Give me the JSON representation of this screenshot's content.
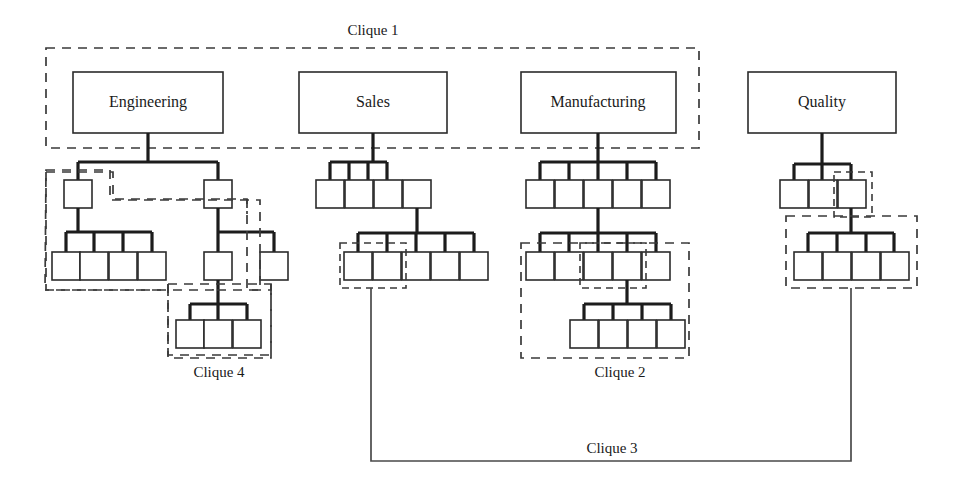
{
  "diagram": {
    "background_color": "#ffffff",
    "line_color": "#1c1c1c",
    "box_fill": "#ffffff",
    "dashed_color": "#3a3a3a"
  },
  "departments": [
    {
      "id": "engineering",
      "label": "Engineering",
      "x": 73,
      "y": 72,
      "w": 150,
      "h": 61
    },
    {
      "id": "sales",
      "label": "Sales",
      "x": 299,
      "y": 72,
      "w": 148,
      "h": 61
    },
    {
      "id": "manufacturing",
      "label": "Manufacturing",
      "x": 521,
      "y": 72,
      "w": 155,
      "h": 61
    },
    {
      "id": "quality",
      "label": "Quality",
      "x": 748,
      "y": 72,
      "w": 148,
      "h": 61
    }
  ],
  "cliques": [
    {
      "id": "clique1",
      "label": "Clique 1",
      "label_x": 373,
      "label_y": 32
    },
    {
      "id": "clique2",
      "label": "Clique 2",
      "label_x": 620,
      "label_y": 374
    },
    {
      "id": "clique3",
      "label": "Clique 3",
      "label_x": 612,
      "label_y": 450
    },
    {
      "id": "clique4",
      "label": "Clique 4",
      "label_x": 219,
      "label_y": 374
    }
  ],
  "node_counts": {
    "engineering_level2": 2,
    "engineering_left_children": 4,
    "engineering_right_children": 2,
    "engineering_grandchildren": 3,
    "sales_level2": 4,
    "sales_level3": 5,
    "manufacturing_level2": 5,
    "manufacturing_level3": 5,
    "manufacturing_level4": 4,
    "quality_level2": 3,
    "quality_level3": 4
  },
  "legend_notes": {
    "clique1_desc": "Top-level departments Engineering, Sales and Manufacturing",
    "clique2_desc": "Manufacturing lower sub-tree",
    "clique3_desc": "Link between Sales sub-group and Quality sub-group",
    "clique4_desc": "Engineering deepest sub-group"
  }
}
